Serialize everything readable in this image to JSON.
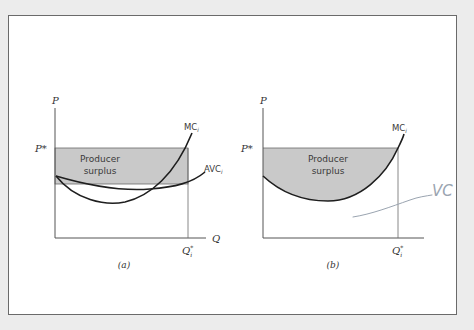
{
  "colors": {
    "background": "#ececec",
    "frame_fill": "#ffffff",
    "frame_border": "#6a6a6a",
    "surplus_fill": "#c9c9c9",
    "axis": "#555555",
    "curve": "#1e1e1e",
    "annotation": "#9aa4b0"
  },
  "panel_a": {
    "y_axis_label": "P",
    "price_label": "P*",
    "x_axis_label": "Q",
    "quantity_label_main": "Q",
    "quantity_label_sup": "*",
    "quantity_label_sub": "i",
    "surplus_line1": "Producer",
    "surplus_line2": "surplus",
    "mc_label_main": "MC",
    "mc_label_sub": "i",
    "avc_label_main": "AVC",
    "avc_label_sub": "i",
    "caption": "(a)"
  },
  "panel_b": {
    "y_axis_label": "P",
    "price_label": "P*",
    "quantity_label_main": "Q",
    "quantity_label_sup": "*",
    "quantity_label_sub": "i",
    "surplus_line1": "Producer",
    "surplus_line2": "surplus",
    "mc_label_main": "MC",
    "mc_label_sub": "i",
    "caption": "(b)"
  },
  "annotation": {
    "handwritten_text": "VC"
  }
}
